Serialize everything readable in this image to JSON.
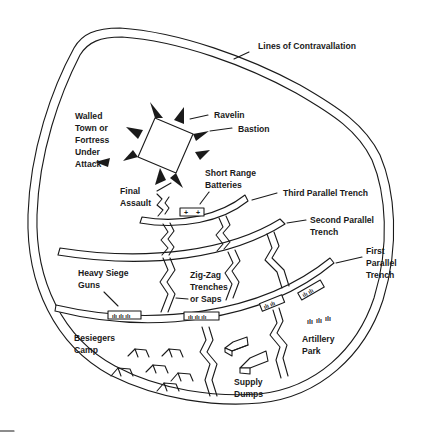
{
  "diagram": {
    "labels": {
      "contravallation": "Lines of Contravallation",
      "walled_town": [
        "Walled",
        "Town or",
        "Fortress",
        "Under",
        "Attack"
      ],
      "ravelin": "Ravelin",
      "bastion": "Bastion",
      "final_assault": [
        "Final",
        "Assault"
      ],
      "short_range_batteries": [
        "Short Range",
        "Batteries"
      ],
      "third_parallel": "Third Parallel Trench",
      "second_parallel": [
        "Second Parallel",
        "Trench"
      ],
      "first_parallel": [
        "First",
        "Parallel",
        "Trench"
      ],
      "heavy_siege_guns": [
        "Heavy Siege",
        "Guns"
      ],
      "zigzag_trenches": [
        "Zig-Zag",
        "Trenches",
        "or Saps"
      ],
      "besiegers_camp": [
        "Besiegers",
        "Camp"
      ],
      "supply_dumps": [
        "Supply",
        "Dumps"
      ],
      "artillery_park": [
        "Artillery",
        "Park"
      ]
    },
    "colors": {
      "ink": "#1a1a1a",
      "background": "#ffffff"
    }
  }
}
